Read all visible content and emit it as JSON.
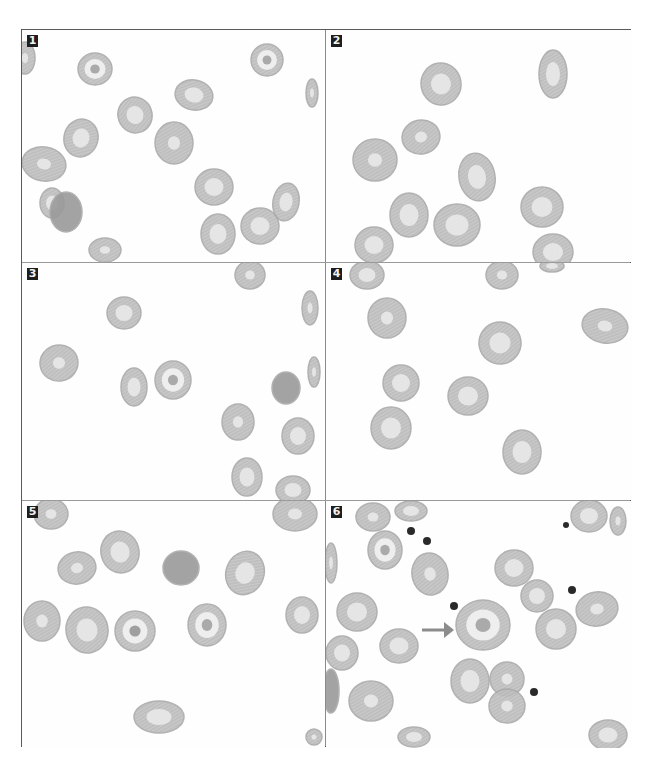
{
  "figure": {
    "panels": [
      {
        "id": 1,
        "label": "1",
        "x": 0,
        "y": 0,
        "w": 303,
        "h": 232,
        "cells": [
          [
            3,
            28,
            10,
            16,
            0,
            "edge"
          ],
          [
            73,
            39,
            17,
            16,
            0,
            "target"
          ],
          [
            245,
            30,
            16,
            16,
            0,
            "target"
          ],
          [
            172,
            65,
            19,
            15,
            10,
            "pale"
          ],
          [
            290,
            63,
            6,
            14,
            0,
            "edge"
          ],
          [
            113,
            85,
            17,
            18,
            -20,
            "pale"
          ],
          [
            59,
            108,
            17,
            19,
            15,
            "pale"
          ],
          [
            152,
            113,
            19,
            21,
            0,
            "normal"
          ],
          [
            22,
            134,
            22,
            17,
            10,
            "normal"
          ],
          [
            192,
            157,
            19,
            18,
            0,
            "pale"
          ],
          [
            264,
            172,
            13,
            19,
            10,
            "pale"
          ],
          [
            30,
            173,
            12,
            15,
            0,
            "pale"
          ],
          [
            44,
            182,
            16,
            20,
            0,
            "dark"
          ],
          [
            196,
            204,
            17,
            20,
            0,
            "pale"
          ],
          [
            238,
            196,
            19,
            18,
            0,
            "pale"
          ],
          [
            83,
            220,
            16,
            12,
            0,
            "normal"
          ]
        ]
      },
      {
        "id": 2,
        "label": "2",
        "x": 304,
        "y": 0,
        "w": 306,
        "h": 232,
        "cells": [
          [
            115,
            54,
            20,
            21,
            -10,
            "pale"
          ],
          [
            227,
            44,
            14,
            24,
            0,
            "pale"
          ],
          [
            95,
            107,
            19,
            17,
            -10,
            "normal"
          ],
          [
            49,
            130,
            22,
            21,
            0,
            "normal"
          ],
          [
            151,
            147,
            18,
            24,
            -10,
            "pale"
          ],
          [
            83,
            185,
            19,
            22,
            0,
            "pale"
          ],
          [
            131,
            195,
            23,
            21,
            0,
            "pale"
          ],
          [
            216,
            177,
            21,
            20,
            0,
            "pale"
          ],
          [
            48,
            215,
            19,
            18,
            0,
            "pale"
          ],
          [
            227,
            222,
            20,
            18,
            0,
            "pale"
          ]
        ]
      },
      {
        "id": 3,
        "label": "3",
        "x": 0,
        "y": 233,
        "w": 303,
        "h": 237,
        "cells": [
          [
            228,
            12,
            15,
            14,
            0,
            "normal"
          ],
          [
            102,
            50,
            17,
            16,
            0,
            "pale"
          ],
          [
            288,
            45,
            8,
            17,
            0,
            "edge"
          ],
          [
            37,
            100,
            19,
            18,
            -10,
            "normal"
          ],
          [
            112,
            124,
            13,
            19,
            0,
            "pale"
          ],
          [
            151,
            117,
            18,
            19,
            0,
            "target"
          ],
          [
            264,
            125,
            14,
            16,
            0,
            "dark"
          ],
          [
            292,
            109,
            6,
            15,
            0,
            "edge"
          ],
          [
            216,
            159,
            16,
            18,
            0,
            "normal"
          ],
          [
            276,
            173,
            16,
            18,
            0,
            "pale"
          ],
          [
            225,
            214,
            15,
            19,
            0,
            "pale"
          ],
          [
            271,
            227,
            17,
            14,
            0,
            "pale"
          ]
        ]
      },
      {
        "id": 4,
        "label": "4",
        "x": 304,
        "y": 233,
        "w": 306,
        "h": 237,
        "cells": [
          [
            41,
            12,
            17,
            14,
            0,
            "pale"
          ],
          [
            176,
            12,
            16,
            14,
            0,
            "normal"
          ],
          [
            226,
            3,
            12,
            6,
            0,
            "pale"
          ],
          [
            61,
            55,
            19,
            20,
            0,
            "normal"
          ],
          [
            174,
            80,
            21,
            21,
            -10,
            "pale"
          ],
          [
            279,
            63,
            23,
            17,
            10,
            "normal"
          ],
          [
            75,
            120,
            18,
            18,
            0,
            "pale"
          ],
          [
            142,
            133,
            20,
            19,
            0,
            "pale"
          ],
          [
            65,
            165,
            20,
            21,
            0,
            "pale"
          ],
          [
            196,
            189,
            19,
            22,
            0,
            "pale"
          ]
        ]
      },
      {
        "id": 5,
        "label": "5",
        "x": 0,
        "y": 471,
        "w": 303,
        "h": 247,
        "cells": [
          [
            29,
            13,
            17,
            15,
            0,
            "normal"
          ],
          [
            273,
            13,
            22,
            17,
            0,
            "normal"
          ],
          [
            98,
            51,
            19,
            21,
            -15,
            "pale"
          ],
          [
            55,
            67,
            19,
            16,
            -10,
            "normal"
          ],
          [
            159,
            67,
            18,
            17,
            0,
            "dark"
          ],
          [
            223,
            72,
            19,
            22,
            20,
            "pale"
          ],
          [
            20,
            120,
            18,
            20,
            0,
            "normal"
          ],
          [
            65,
            129,
            21,
            23,
            -10,
            "pale"
          ],
          [
            113,
            130,
            20,
            20,
            0,
            "darkring"
          ],
          [
            185,
            124,
            19,
            21,
            0,
            "target"
          ],
          [
            280,
            114,
            16,
            18,
            0,
            "pale"
          ],
          [
            137,
            216,
            25,
            16,
            0,
            "pale"
          ],
          [
            292,
            236,
            8,
            8,
            0,
            "edge"
          ]
        ]
      },
      {
        "id": 6,
        "label": "6",
        "x": 304,
        "y": 471,
        "w": 306,
        "h": 247,
        "cells": [
          [
            47,
            16,
            17,
            14,
            0,
            "normal"
          ],
          [
            85,
            10,
            16,
            10,
            0,
            "pale"
          ],
          [
            263,
            15,
            18,
            16,
            0,
            "pale"
          ],
          [
            292,
            20,
            8,
            14,
            0,
            "edge"
          ],
          [
            59,
            49,
            17,
            19,
            0,
            "target"
          ],
          [
            5,
            62,
            6,
            20,
            0,
            "edge"
          ],
          [
            104,
            73,
            18,
            21,
            -10,
            "normal"
          ],
          [
            188,
            67,
            19,
            18,
            0,
            "pale"
          ],
          [
            31,
            111,
            20,
            19,
            0,
            "pale"
          ],
          [
            211,
            95,
            16,
            16,
            0,
            "pale"
          ],
          [
            271,
            108,
            21,
            17,
            -10,
            "normal"
          ],
          [
            157,
            124,
            27,
            25,
            0,
            "macro"
          ],
          [
            230,
            128,
            20,
            20,
            0,
            "pale"
          ],
          [
            16,
            152,
            16,
            17,
            0,
            "pale"
          ],
          [
            73,
            145,
            19,
            17,
            0,
            "pale"
          ],
          [
            144,
            180,
            19,
            22,
            0,
            "pale"
          ],
          [
            181,
            178,
            17,
            17,
            0,
            "normal"
          ],
          [
            181,
            205,
            18,
            17,
            0,
            "normal"
          ],
          [
            5,
            190,
            8,
            22,
            0,
            "dark"
          ],
          [
            45,
            200,
            22,
            20,
            0,
            "normal"
          ],
          [
            88,
            236,
            16,
            10,
            0,
            "pale"
          ],
          [
            282,
            234,
            19,
            15,
            0,
            "pale"
          ]
        ],
        "platelets": [
          [
            85,
            30,
            4
          ],
          [
            101,
            40,
            4
          ],
          [
            128,
            105,
            4
          ],
          [
            240,
            24,
            3
          ],
          [
            246,
            89,
            4
          ],
          [
            208,
            191,
            4
          ]
        ],
        "arrow": {
          "x1": 96,
          "y1": 129,
          "x2": 128,
          "y2": 129
        }
      }
    ],
    "colors": {
      "border": "#5a5a5a",
      "divider": "#8a8a8a",
      "cell_rim": "#a9a9a9",
      "cell_fill": "#b9b9b9",
      "cell_pallor": "#eeeeee",
      "dark_cell": "#9a9a9a",
      "platelet": "#2a2a2a",
      "arrow": "#8c8c8c",
      "label_bg": "#1e1e1e",
      "label_text": "#f2f2f2"
    }
  }
}
